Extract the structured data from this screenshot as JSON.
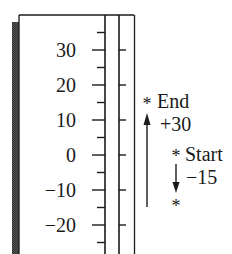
{
  "figure": {
    "type": "number-line-thermometer",
    "scale": {
      "major_labels": [
        "30",
        "20",
        "10",
        "0",
        "−10",
        "−20"
      ],
      "major_values": [
        30,
        20,
        10,
        0,
        -10,
        -20
      ],
      "minor_values": [
        35,
        25,
        15,
        5,
        -5,
        -15,
        -25
      ]
    },
    "annotations": {
      "end": {
        "label": "End",
        "marker": "*",
        "value": 15,
        "change_label": "+30",
        "arrow_direction": "up"
      },
      "start": {
        "label": "Start",
        "marker": "*",
        "value": 0,
        "change_label": "−15",
        "arrow_direction": "down"
      },
      "intermediate": {
        "marker": "*",
        "value": -15
      }
    },
    "colors": {
      "ink": "#1a1a1a",
      "shadow": "#4a4a4a",
      "background": "#ffffff"
    }
  }
}
